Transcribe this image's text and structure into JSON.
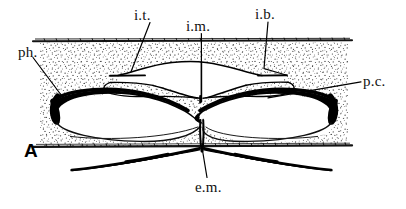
{
  "figure": {
    "panel_letter": "A",
    "type": "anatomical line drawing",
    "background_color": "#ffffff",
    "ink_color": "#000000",
    "stipple_color": "#3a3a3a"
  },
  "labels": {
    "it": "i.t.",
    "im": "i.m.",
    "ib": "i.b.",
    "ph": "ph.",
    "pc": "p.c.",
    "em": "e.m."
  },
  "label_positions": {
    "it": {
      "x": 134,
      "y": 8,
      "anchor": "top-center",
      "leader": "down-left"
    },
    "im": {
      "x": 186,
      "y": 19,
      "anchor": "top-center",
      "leader": "straight-down"
    },
    "ib": {
      "x": 255,
      "y": 7,
      "anchor": "top-center",
      "leader": "down-then-bend"
    },
    "ph": {
      "x": 18,
      "y": 45,
      "anchor": "left",
      "leader": "down-right"
    },
    "pc": {
      "x": 363,
      "y": 74,
      "anchor": "right",
      "leader": "long-left"
    },
    "em": {
      "x": 195,
      "y": 180,
      "anchor": "bottom-center",
      "leader": "up"
    }
  },
  "structures": {
    "tissue_band": {
      "name": "stippled-tissue-band",
      "left": 40,
      "right": 348,
      "top": 42,
      "bottom": 145
    },
    "top_border_line": {
      "y": 41,
      "x1": 33,
      "x2": 352
    },
    "bottom_border_line": {
      "y": 146,
      "x1": 33,
      "x2": 352
    },
    "left_lobe": {
      "name": "left-thick-black-lobe"
    },
    "right_lobe": {
      "name": "right-thick-black-lobe"
    },
    "inner_chamber": {
      "name": "central-inner-chamber"
    },
    "lower_tails": {
      "name": "lower-wavy-tails",
      "count": 2
    }
  }
}
